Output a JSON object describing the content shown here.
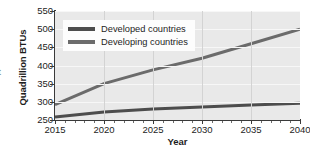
{
  "figure": {
    "edge_fragment": "t"
  },
  "chart_data": {
    "type": "line",
    "title": "",
    "xlabel": "Year",
    "ylabel": "Quadrillion BTUs",
    "xlim": [
      2015,
      2040
    ],
    "ylim": [
      250,
      550
    ],
    "grid": true,
    "legend_position": "upper left (inside plot)",
    "xticks": [
      2015,
      2020,
      2025,
      2030,
      2035,
      2040
    ],
    "xtick_labels": [
      "2015",
      "2020",
      "2025",
      "2030",
      "2035",
      "2040"
    ],
    "yticks": [
      250,
      300,
      350,
      400,
      450,
      500,
      550
    ],
    "ytick_labels": [
      "250",
      "300",
      "350",
      "400",
      "450",
      "500",
      "550"
    ],
    "x": [
      2015,
      2020,
      2025,
      2030,
      2035,
      2040
    ],
    "series": [
      {
        "name": "Developed countries",
        "color": "#4d4d4d",
        "values": [
          258,
          272,
          280,
          286,
          291,
          296
        ]
      },
      {
        "name": "Developing countries",
        "color": "#6b6b6b",
        "values": [
          292,
          350,
          388,
          420,
          460,
          500
        ]
      }
    ],
    "legend": [
      {
        "label": "Developed countries",
        "color": "#4d4d4d"
      },
      {
        "label": "Developing countries",
        "color": "#6b6b6b"
      }
    ],
    "colors": {
      "plot_background": "#e9e9e9",
      "gridline": "#f7f7f7",
      "axis": "#3a3a3a",
      "text": "#1d1d1d",
      "legend_background": "#fdfdfd"
    }
  }
}
